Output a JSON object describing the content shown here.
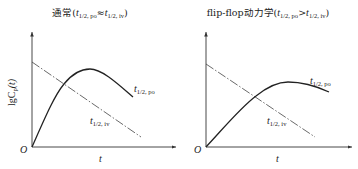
{
  "panels": [
    {
      "title_prefix": "通常(",
      "title_t1": "t",
      "title_sub1": "1/2, po",
      "title_rel": "≈",
      "title_t2": "t",
      "title_sub2": "1/2, iv",
      "title_suffix": ")",
      "ylabel_main": "lgC",
      "ylabel_sub": "p",
      "ylabel_arg": "(t)",
      "origin_label": "O",
      "xlabel": "t",
      "po_label_t": "t",
      "po_label_sub": "1/2, po",
      "iv_label_t": "t",
      "iv_label_sub": "1/2, iv"
    },
    {
      "title_prefix": "flip-flop动力学(",
      "title_t1": "t",
      "title_sub1": "1/2, po",
      "title_rel": ">",
      "title_t2": "t",
      "title_sub2": "1/2, iv",
      "title_suffix": ")",
      "origin_label": "O",
      "xlabel": "t",
      "po_label_t": "t",
      "po_label_sub": "1/2, po",
      "iv_label_t": "t",
      "iv_label_sub": "1/2, iv"
    }
  ],
  "colors": {
    "line": "#222222",
    "background": "#ffffff"
  }
}
